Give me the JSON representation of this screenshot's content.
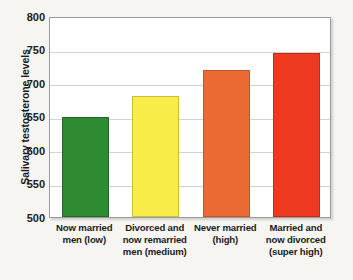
{
  "chart_data": {
    "type": "bar",
    "title": "",
    "xlabel": "",
    "ylabel": "Salivary testosterone levels",
    "ylim": [
      500,
      800
    ],
    "yticks": [
      500,
      550,
      600,
      650,
      700,
      750,
      800
    ],
    "ytick_labels": [
      "500",
      "550",
      "600",
      "650",
      "700",
      "750",
      "800"
    ],
    "grid": true,
    "legend": false,
    "categories": [
      "Now married men (low)",
      "Divorced and now remarried men (medium)",
      "Never married (high)",
      "Married and now divorced (super high)"
    ],
    "category_lines": [
      [
        "Now married",
        "men (low)"
      ],
      [
        "Divorced and",
        "now remarried",
        "men (medium)"
      ],
      [
        "Never married",
        "(high)"
      ],
      [
        "Married and",
        "now divorced",
        "(super high)"
      ]
    ],
    "values": [
      650,
      680,
      720,
      745
    ],
    "bar_colors": [
      "#2e8b32",
      "#f7ec48",
      "#eb6a33",
      "#ee3a20"
    ],
    "bar_stroke_colors": [
      "#1f6a24",
      "#c9bf34",
      "#c4542a",
      "#c22c17"
    ]
  },
  "style": {
    "page_background": "#f6f5f1",
    "plot_background": "#ffffff",
    "gridline_color": "#d2d2d2",
    "frame_color": "#9a9a9a",
    "text_color": "#1b1b1b"
  }
}
